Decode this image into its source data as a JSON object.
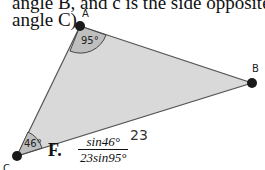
{
  "question_text": {
    "line1": "angle B, and c is the side opposite",
    "line2": "angle C)"
  },
  "triangle": {
    "vertices": {
      "A": "A",
      "B": "B",
      "C": "C"
    },
    "angle_A": "95°",
    "angle_C": "46°",
    "side_CB": "23",
    "fill_color": "#d9d9d9",
    "edge_color": "#555555",
    "arc_fill_color": "#bfbfbf"
  },
  "answer_option": {
    "label": "F.",
    "numerator": "sin46°",
    "denominator": "23sin95°"
  }
}
